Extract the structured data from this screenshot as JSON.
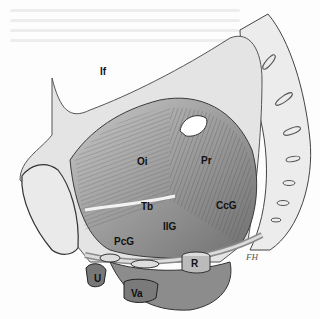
{
  "figure": {
    "labels": [
      {
        "id": "If",
        "text": "If",
        "x": 100,
        "y": 67
      },
      {
        "id": "Oi",
        "text": "Oi",
        "x": 137,
        "y": 157
      },
      {
        "id": "Pr",
        "text": "Pr",
        "x": 201,
        "y": 156
      },
      {
        "id": "Tb",
        "text": "Tb",
        "x": 141,
        "y": 202
      },
      {
        "id": "IIG",
        "text": "IIG",
        "x": 163,
        "y": 222
      },
      {
        "id": "CcG",
        "text": "CcG",
        "x": 216,
        "y": 201
      },
      {
        "id": "PcG",
        "text": "PcG",
        "x": 114,
        "y": 237
      },
      {
        "id": "R",
        "text": "R",
        "x": 191,
        "y": 259
      },
      {
        "id": "U",
        "text": "U",
        "x": 94,
        "y": 274
      },
      {
        "id": "Va",
        "text": "Va",
        "x": 131,
        "y": 289
      }
    ],
    "signature": "FH"
  },
  "colors": {
    "ink": "#333333",
    "shade": "#9a9a9a",
    "light": "#e6e6e6",
    "paper": "#fdfdfd"
  }
}
